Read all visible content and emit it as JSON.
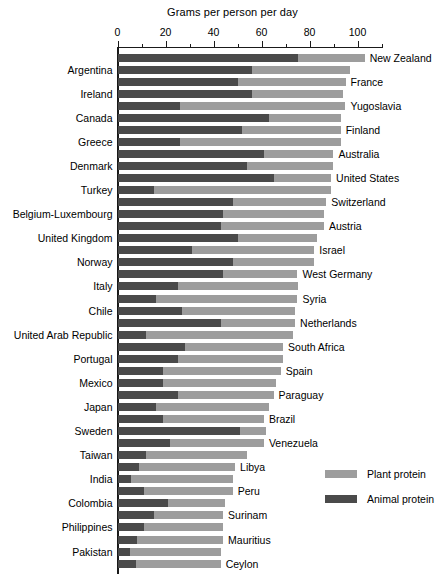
{
  "chart_data": {
    "type": "bar",
    "orientation": "horizontal",
    "stacked": true,
    "title": "Grams per person per day",
    "xlabel": "Grams per person per day",
    "ylabel": "",
    "xlim": [
      0,
      110
    ],
    "grid": false,
    "tick_labels": [
      "0",
      "20",
      "40",
      "60",
      "80",
      "100"
    ],
    "tick_values": [
      0,
      20,
      40,
      60,
      80,
      100
    ],
    "minor_tick_values": [
      10,
      30,
      50,
      70,
      90,
      110
    ],
    "legend_position": "right-lower",
    "series": [
      {
        "name": "Plant protein",
        "color": "#9d9d9d"
      },
      {
        "name": "Animal protein",
        "color": "#4a4a4a"
      }
    ],
    "categories": [
      "New Zealand",
      "Argentina",
      "France",
      "Ireland",
      "Yugoslavia",
      "Canada",
      "Finland",
      "Greece",
      "Australia",
      "Denmark",
      "United States",
      "Turkey",
      "Switzerland",
      "Belgium-Luxembourg",
      "Austria",
      "United Kingdom",
      "Israel",
      "Norway",
      "West Germany",
      "Italy",
      "Syria",
      "Chile",
      "Netherlands",
      "United Arab Republic",
      "South Africa",
      "Portugal",
      "Spain",
      "Mexico",
      "Paraguay",
      "Japan",
      "Brazil",
      "Sweden",
      "Venezuela",
      "Taiwan",
      "Libya",
      "India",
      "Peru",
      "Colombia",
      "Surinam",
      "Philippines",
      "Mauritius",
      "Pakistan",
      "Ceylon"
    ],
    "label_sides": [
      "right",
      "left",
      "right",
      "left",
      "right",
      "left",
      "right",
      "left",
      "right",
      "left",
      "right",
      "left",
      "right",
      "left",
      "right",
      "left",
      "right",
      "left",
      "right",
      "left",
      "right",
      "left",
      "right",
      "left",
      "right",
      "left",
      "right",
      "left",
      "right",
      "left",
      "right",
      "left",
      "right",
      "left",
      "right",
      "left",
      "right",
      "left",
      "right",
      "left",
      "right",
      "left",
      "right"
    ],
    "animal_protein": [
      75,
      56,
      50,
      56,
      26,
      63,
      52,
      26,
      61,
      54,
      65,
      15,
      48,
      44,
      43,
      50,
      31,
      48,
      44,
      25,
      16,
      27,
      43,
      12,
      28,
      25,
      19,
      19,
      25,
      16,
      19,
      51,
      22,
      12,
      9,
      5.5,
      11,
      21,
      15,
      11,
      8,
      5,
      7.5
    ],
    "total_protein": [
      103,
      97,
      95,
      94,
      95,
      93,
      93,
      93,
      90,
      90,
      89,
      89,
      87,
      86,
      86,
      83,
      82,
      82,
      75,
      75,
      75,
      74,
      74,
      73,
      69,
      69,
      68,
      66,
      65,
      63,
      61,
      62,
      61,
      54,
      49,
      48,
      48,
      45,
      44,
      44,
      44,
      43,
      43
    ]
  },
  "legend": {
    "items": [
      {
        "label": "Plant protein",
        "color": "#9d9d9d"
      },
      {
        "label": "Animal protein",
        "color": "#4a4a4a"
      }
    ]
  }
}
